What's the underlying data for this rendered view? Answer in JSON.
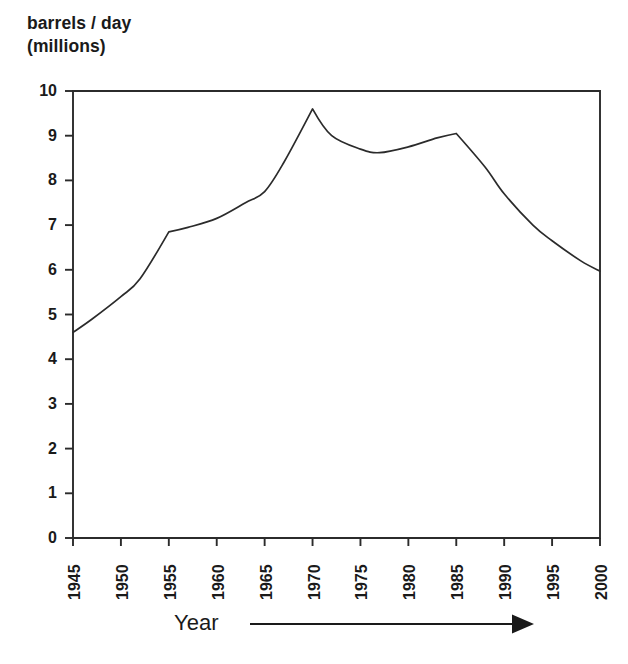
{
  "chart_data": {
    "type": "line",
    "title": "barrels / day\n(millions)",
    "ylabel": "barrels / day (millions)",
    "xlabel": "Year",
    "xlabel_arrow": "⟶",
    "grid": false,
    "legend": null,
    "xlim": [
      1945,
      2000
    ],
    "ylim": [
      0,
      10
    ],
    "xticks": [
      1945,
      1950,
      1955,
      1960,
      1965,
      1970,
      1975,
      1980,
      1985,
      1990,
      1995,
      2000
    ],
    "xtick_labels": [
      "1945",
      "1950",
      "1955",
      "1960",
      "1965",
      "1970",
      "1975",
      "1980",
      "1985",
      "1990",
      "1995",
      "2000"
    ],
    "yticks": [
      0,
      1,
      2,
      3,
      4,
      5,
      6,
      7,
      8,
      9,
      10
    ],
    "ytick_labels": [
      "0",
      "1",
      "2",
      "3",
      "4",
      "5",
      "6",
      "7",
      "8",
      "9",
      "10"
    ],
    "x": [
      1945,
      1947,
      1950,
      1952,
      1955,
      1957,
      1960,
      1963,
      1965,
      1967,
      1970,
      1972,
      1975,
      1977,
      1980,
      1983,
      1985,
      1988,
      1990,
      1993,
      1995,
      1998,
      2000
    ],
    "values": [
      4.6,
      4.9,
      5.4,
      5.8,
      6.85,
      6.95,
      7.15,
      7.5,
      7.75,
      8.4,
      9.6,
      9.0,
      8.7,
      8.62,
      8.75,
      8.95,
      9.05,
      8.3,
      7.7,
      7.0,
      6.65,
      6.2,
      5.97
    ],
    "series_name": "U.S. oil production",
    "annotations": {
      "peak_year": 1970,
      "peak_value": 9.6,
      "kink_year": 1955,
      "kink_value": 6.85,
      "trough_year": 1977,
      "trough_value": 8.62,
      "secondary_peak_year": 1985,
      "secondary_peak_value": 9.05,
      "start_value": 4.6,
      "end_value": 5.97
    },
    "colors": {
      "line": "#2b2b2b",
      "axis": "#2b2b2b",
      "background": "#ffffff",
      "text": "#1a1a1a"
    }
  }
}
